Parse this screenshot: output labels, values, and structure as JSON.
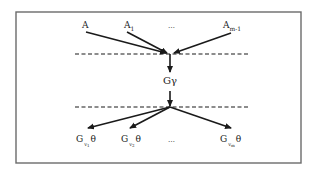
{
  "diagram": {
    "type": "flow",
    "frame": {
      "x": 16,
      "y": 12,
      "width": 285,
      "height": 151,
      "color": "#6b6b6b"
    },
    "colors": {
      "line": "#1a1a1a",
      "text": "#222222",
      "background": "#ffffff"
    },
    "top_inputs": [
      {
        "base": "A",
        "sub": ""
      },
      {
        "base": "A",
        "sub": "1"
      },
      {
        "base": "…",
        "sub": ""
      },
      {
        "base": "A",
        "sub": "m-1"
      }
    ],
    "center_node": {
      "label": "Gγ"
    },
    "bottom_outputs": [
      {
        "base": "G",
        "sub": "v",
        "subsub": "1",
        "suffix": "θ"
      },
      {
        "base": "G",
        "sub": "v",
        "subsub": "2",
        "suffix": "θ"
      },
      {
        "base": "…",
        "sub": "",
        "subsub": "",
        "suffix": ""
      },
      {
        "base": "G",
        "sub": "v",
        "subsub": "m",
        "suffix": "θ"
      }
    ],
    "separators": [
      {
        "y": 54,
        "style": "dashed"
      },
      {
        "y": 107,
        "style": "dashed"
      }
    ]
  }
}
